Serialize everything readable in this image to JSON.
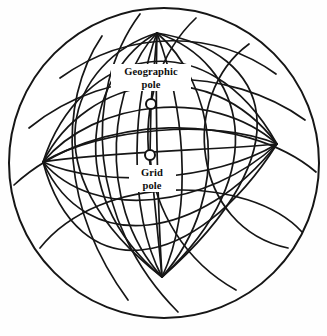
{
  "figure": {
    "background_color": "#fefefe",
    "line_color": "#161616",
    "outer_circle": {
      "cx": 164,
      "cy": 163,
      "r": 155
    }
  },
  "labels": {
    "geographic_pole": {
      "line1": "Geographic",
      "line2": "pole",
      "x": 151,
      "y_line1": 75,
      "y_line2": 88
    },
    "grid_pole": {
      "line1": "Grid",
      "line2": "pole",
      "x": 152,
      "y_line1": 176,
      "y_line2": 189
    }
  },
  "poles": [
    {
      "name": "geographic-pole-marker",
      "cx": 151,
      "cy": 104,
      "r": 5.0
    },
    {
      "name": "grid-pole-marker",
      "cx": 150,
      "cy": 155,
      "r": 5.0
    }
  ],
  "nodes": [
    {
      "name": "top-node",
      "x": 157,
      "y": 33
    },
    {
      "name": "left-node",
      "x": 43,
      "y": 162
    },
    {
      "name": "right-node",
      "x": 277,
      "y": 144
    },
    {
      "name": "bottom-node",
      "x": 162,
      "y": 277
    }
  ],
  "graticules": {
    "geographic": {
      "pole_node": "top-node",
      "antipode_node": "bottom-node"
    },
    "grid": {
      "pole_node": "left-node",
      "antipode_node": "right-node"
    }
  }
}
